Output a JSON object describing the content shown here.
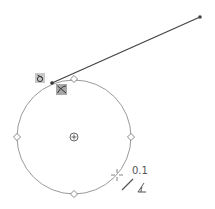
{
  "canvas": {
    "width": 215,
    "height": 209,
    "background": "#ffffff"
  },
  "sketch": {
    "circle": {
      "cx": 74,
      "cy": 137,
      "r": 57,
      "stroke": "#9a9a9a"
    },
    "quadrant_points": [
      {
        "x": 74,
        "y": 79
      },
      {
        "x": 131,
        "y": 137
      },
      {
        "x": 74,
        "y": 194
      },
      {
        "x": 17,
        "y": 137
      }
    ],
    "center_marker": {
      "x": 74,
      "y": 137
    },
    "line": {
      "x1": 52,
      "y1": 83,
      "x2": 200,
      "y2": 17,
      "stroke": "#444444"
    },
    "line_endpoint": {
      "x": 200,
      "y": 17
    },
    "line_startpoint": {
      "x": 52,
      "y": 83
    }
  },
  "relation_icons": [
    {
      "name": "coincident-relation-icon",
      "x": 35,
      "y": 74
    },
    {
      "name": "tangent-relation-icon",
      "x": 56,
      "y": 84
    }
  ],
  "cursor": {
    "x": 117,
    "y": 175,
    "dimension_label": "0.1"
  }
}
